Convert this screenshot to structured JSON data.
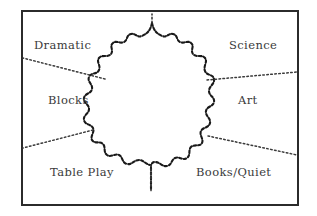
{
  "figure": {
    "kind": "classroom-zone-layout-diagram",
    "border_color": "#2b2b2b",
    "line_color": "#1a1a1a",
    "text_color": "#3a3a3a",
    "background_color": "#ffffff",
    "center_region": {
      "name": "central-open-area",
      "outline_style": "irregular-scalloped-dotted"
    },
    "zones": [
      {
        "id": "dramatic",
        "label": "Dramatic",
        "position": "top-left"
      },
      {
        "id": "science",
        "label": "Science",
        "position": "top-right"
      },
      {
        "id": "blocks",
        "label": "Blocks",
        "position": "middle-left"
      },
      {
        "id": "art",
        "label": "Art",
        "position": "middle-right"
      },
      {
        "id": "table-play",
        "label": "Table Play",
        "position": "bottom-left"
      },
      {
        "id": "books-quiet",
        "label": "Books/Quiet",
        "position": "bottom-right"
      }
    ],
    "dividers": [
      {
        "id": "divider-top",
        "style": "dotted",
        "from": "center-top",
        "to": "frame-top"
      },
      {
        "id": "divider-upper-left",
        "style": "dotted",
        "from": "center-upper-left",
        "to": "frame-left"
      },
      {
        "id": "divider-lower-left",
        "style": "dotted",
        "from": "center-lower-left",
        "to": "frame-left"
      },
      {
        "id": "divider-upper-right",
        "style": "dotted",
        "from": "center-upper-right",
        "to": "frame-right"
      },
      {
        "id": "divider-lower-right",
        "style": "dotted",
        "from": "center-lower-right",
        "to": "frame-right"
      },
      {
        "id": "divider-bottom",
        "style": "dotted",
        "from": "center-bottom",
        "to": "frame-bottom"
      }
    ]
  }
}
